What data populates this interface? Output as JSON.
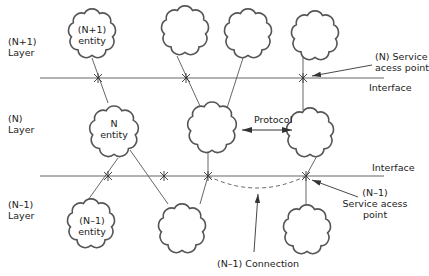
{
  "layers": [
    {
      "id": "n_plus_1",
      "label_line1": "(N+1)",
      "label_line2": "Layer"
    },
    {
      "id": "n",
      "label_line1": "(N)",
      "label_line2": "Layer"
    },
    {
      "id": "n_minus_1",
      "label_line1": "(N–1)",
      "label_line2": "Layer"
    }
  ],
  "entities": {
    "n_plus_1": {
      "line1": "(N+1)",
      "line2": "entity"
    },
    "n": {
      "line1": "N",
      "line2": "entity"
    },
    "n_minus_1": {
      "line1": "(N–1)",
      "line2": "entity"
    }
  },
  "interfaces": {
    "top": "Interface",
    "bottom": "Interface"
  },
  "annotations": {
    "n_sap_line1": "(N) Service",
    "n_sap_line2": "acess point",
    "protocol": "Protocol",
    "n_minus_1_sap_line1": "(N–1)",
    "n_minus_1_sap_line2": "Service acess",
    "n_minus_1_sap_line3": "point",
    "connection": "(N–1) Connection"
  },
  "colors": {
    "line": "#555555",
    "text": "#222222",
    "background": "#ffffff"
  }
}
